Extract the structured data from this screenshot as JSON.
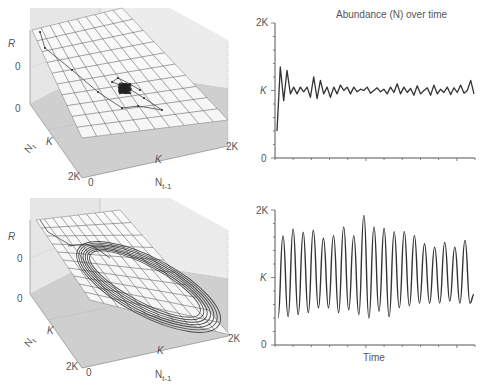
{
  "chart_data": [
    {
      "type": "surface3d",
      "panel": "top-left",
      "axes": {
        "z_label": "R",
        "y_label": "N_t",
        "x_label": "N_{t-1}",
        "z_ticks": [
          "0",
          "0"
        ],
        "y_ticks": [
          "K",
          "2K"
        ],
        "x_ticks": [
          "0",
          "K",
          "2K"
        ]
      },
      "description": "Trajectory converging to a dense cluster near (K, K) on a sloped plane"
    },
    {
      "type": "line",
      "panel": "top-right",
      "title": "Abundance (N) over time",
      "xlabel": "",
      "ylabel": "",
      "yticks": [
        "0",
        "K",
        "2K"
      ],
      "ylim": [
        0,
        2
      ],
      "values": [
        0.4,
        1.35,
        0.85,
        1.3,
        0.95,
        1.05,
        0.95,
        1.05,
        0.98,
        1.05,
        0.9,
        1.2,
        0.88,
        1.15,
        0.95,
        1.05,
        0.9,
        1.05,
        0.95,
        1.08,
        1.0,
        1.05,
        0.95,
        1.05,
        0.98,
        1.02,
        1.0,
        1.05,
        0.96,
        1.0,
        1.04,
        0.98,
        1.02,
        0.95,
        1.05,
        0.97,
        1.1,
        0.95,
        1.05,
        0.97,
        1.03,
        0.93,
        1.07,
        0.95,
        1.0,
        1.04,
        0.93,
        1.08,
        0.95,
        1.02,
        0.97,
        1.05,
        0.94,
        1.04,
        0.97,
        1.08,
        0.96,
        1.0,
        1.15,
        0.95
      ]
    },
    {
      "type": "surface3d",
      "panel": "bottom-left",
      "axes": {
        "z_label": "R",
        "y_label": "N_t",
        "x_label": "N_{t-1}",
        "z_ticks": [
          "0",
          "0"
        ],
        "y_ticks": [
          "K",
          "2K"
        ],
        "x_ticks": [
          "0",
          "K",
          "2K"
        ]
      },
      "description": "Trajectory tracing an elliptical limit cycle on a sloped plane"
    },
    {
      "type": "line",
      "panel": "bottom-right",
      "xlabel": "Time",
      "ylabel": "",
      "yticks": [
        "0",
        "K",
        "2K"
      ],
      "ylim": [
        0,
        2
      ],
      "peaks": [
        1.62,
        1.72,
        1.67,
        1.7,
        1.58,
        1.62,
        1.75,
        1.62,
        1.92,
        1.75,
        1.73,
        1.68,
        1.68,
        1.62,
        1.5,
        1.45,
        1.52,
        1.45,
        1.55
      ],
      "troughs": [
        0.4,
        0.42,
        0.45,
        0.48,
        0.55,
        0.55,
        0.48,
        0.52,
        0.45,
        0.4,
        0.5,
        0.42,
        0.55,
        0.58,
        0.62,
        0.62,
        0.62,
        0.65,
        0.62
      ]
    }
  ],
  "labels": {
    "title_top": "Abundance (N) over time",
    "time_label": "Time",
    "R": "R",
    "Nt": "N",
    "Nt_sub": "t",
    "Nt1": "N",
    "Nt1_sub": "t-1",
    "zero": "0",
    "K": "K",
    "twoK": "2K"
  }
}
